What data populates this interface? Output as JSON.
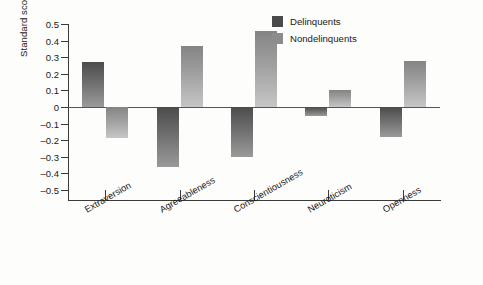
{
  "chart_data": {
    "type": "bar",
    "title": "",
    "xlabel": "",
    "ylabel": "Standard scores",
    "categories": [
      "Extraversion",
      "Agreeableness",
      "Conscientiousness",
      "Neuroticism",
      "Openness"
    ],
    "series": [
      {
        "name": "Delinquents",
        "color": "#4a4a4a",
        "values": [
          0.27,
          -0.36,
          -0.3,
          -0.055,
          -0.18
        ]
      },
      {
        "name": "Nondelinquents",
        "color": "#8c8c8c",
        "values": [
          -0.185,
          0.365,
          0.455,
          0.105,
          0.275
        ]
      }
    ],
    "ylim": [
      -0.5,
      0.5
    ],
    "yticks": [
      0.5,
      0.4,
      0.3,
      0.2,
      0.1,
      0,
      -0.1,
      -0.2,
      -0.3,
      -0.4,
      -0.5
    ],
    "ytick_labels": [
      "0.5",
      "0.4",
      "0.3",
      "0.2",
      "0.1",
      "0",
      "–0.1",
      "–0.2",
      "–0.3",
      "–0.4",
      "–0.5"
    ],
    "grid": false,
    "legend_position": "top-right",
    "zero_line": true
  }
}
